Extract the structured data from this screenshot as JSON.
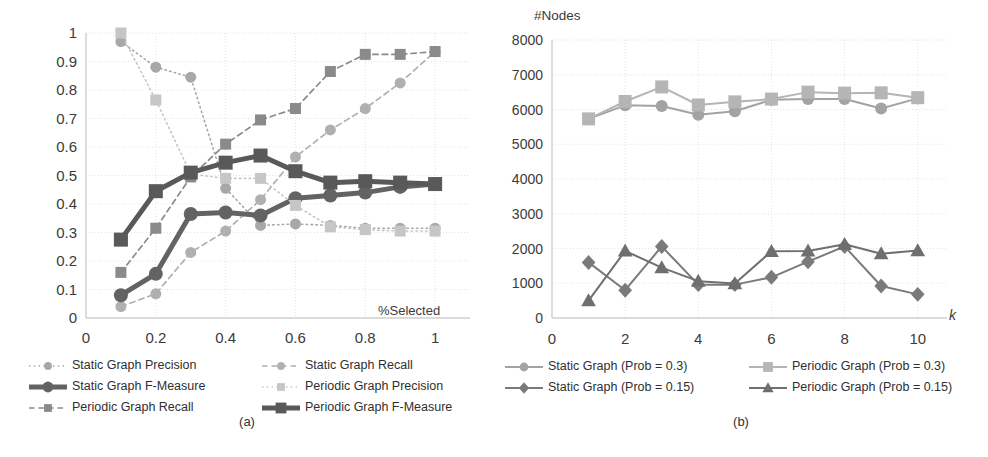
{
  "figure": {
    "panels": [
      {
        "id": "a",
        "caption": "(a)",
        "chart_data": {
          "type": "line",
          "title": "",
          "xlabel": "%Selected",
          "ylabel": "",
          "xlim": [
            0,
            1.1
          ],
          "ylim": [
            0,
            1
          ],
          "xticks": [
            "0",
            "0.2",
            "0.4",
            "0.6",
            "0.8",
            "1"
          ],
          "xtick_values": [
            0,
            0.2,
            0.4,
            0.6,
            0.8,
            1.0
          ],
          "yticks": [
            "0",
            "0.1",
            "0.2",
            "0.3",
            "0.4",
            "0.5",
            "0.6",
            "0.7",
            "0.8",
            "0.9",
            "1"
          ],
          "ytick_values": [
            0,
            0.1,
            0.2,
            0.3,
            0.4,
            0.5,
            0.6,
            0.7,
            0.8,
            0.9,
            1.0
          ],
          "grid": true,
          "legend_position": "below",
          "x": [
            0.1,
            0.2,
            0.3,
            0.4,
            0.5,
            0.6,
            0.7,
            0.8,
            0.9,
            1.0
          ],
          "series": [
            {
              "name": "Static Graph Precision",
              "key": "static-precision",
              "values": [
                0.97,
                0.88,
                0.845,
                0.455,
                0.325,
                0.33,
                0.325,
                0.315,
                0.315,
                0.315
              ],
              "color": "#a8a8a8",
              "style": "dotted",
              "marker": "circle",
              "width": 1.6,
              "marker_size": 5.5
            },
            {
              "name": "Static Graph Recall",
              "key": "static-recall",
              "values": [
                0.04,
                0.085,
                0.23,
                0.305,
                0.415,
                0.565,
                0.66,
                0.735,
                0.825,
                0.935
              ],
              "color": "#b0b0b0",
              "style": "dashed",
              "marker": "circle",
              "width": 1.7,
              "marker_size": 5.5
            },
            {
              "name": "Static Graph F-Measure",
              "key": "static-fmeasure",
              "values": [
                0.08,
                0.155,
                0.365,
                0.37,
                0.36,
                0.42,
                0.43,
                0.44,
                0.46,
                0.47
              ],
              "color": "#636363",
              "style": "solid",
              "marker": "circle",
              "width": 5,
              "marker_size": 7
            },
            {
              "name": "Periodic Graph Precision",
              "key": "periodic-precision",
              "values": [
                1.0,
                0.765,
                0.505,
                0.49,
                0.49,
                0.395,
                0.32,
                0.31,
                0.305,
                0.305
              ],
              "color": "#c6c6c6",
              "style": "dotted",
              "marker": "square",
              "width": 1.6,
              "marker_size": 5.5
            },
            {
              "name": "Periodic Graph Recall",
              "key": "periodic-recall",
              "values": [
                0.16,
                0.315,
                0.495,
                0.61,
                0.695,
                0.735,
                0.865,
                0.925,
                0.925,
                0.935
              ],
              "color": "#8a8a8a",
              "style": "dashed",
              "marker": "square",
              "width": 1.7,
              "marker_size": 5.5
            },
            {
              "name": "Periodic Graph F-Measure",
              "key": "periodic-fmeasure",
              "values": [
                0.275,
                0.445,
                0.51,
                0.545,
                0.57,
                0.515,
                0.475,
                0.48,
                0.475,
                0.47
              ],
              "color": "#595959",
              "style": "solid",
              "marker": "square",
              "width": 5,
              "marker_size": 7
            }
          ]
        }
      },
      {
        "id": "b",
        "caption": "(b)",
        "chart_data": {
          "type": "line",
          "title": "",
          "xlabel": "k",
          "ylabel": "#Nodes",
          "xlim": [
            0,
            10.8
          ],
          "ylim": [
            0,
            8000
          ],
          "xticks": [
            "0",
            "2",
            "4",
            "6",
            "8",
            "10"
          ],
          "xtick_values": [
            0,
            2,
            4,
            6,
            8,
            10
          ],
          "yticks": [
            "0",
            "1000",
            "2000",
            "3000",
            "4000",
            "5000",
            "6000",
            "7000",
            "8000"
          ],
          "ytick_values": [
            0,
            1000,
            2000,
            3000,
            4000,
            5000,
            6000,
            7000,
            8000
          ],
          "grid": true,
          "legend_position": "below",
          "x": [
            1,
            2,
            3,
            4,
            5,
            6,
            7,
            8,
            9,
            10
          ],
          "series": [
            {
              "name": "Static Graph (Prob = 0.3)",
              "key": "static-prob-03",
              "values": [
                5730,
                6120,
                6100,
                5850,
                5950,
                6280,
                6300,
                6300,
                6030,
                6320
              ],
              "color": "#a3a3a3",
              "style": "solid",
              "marker": "circle",
              "width": 2,
              "marker_size": 6
            },
            {
              "name": "Periodic Graph (Prob = 0.3)",
              "key": "periodic-prob-03",
              "values": [
                5730,
                6230,
                6650,
                6130,
                6220,
                6300,
                6500,
                6470,
                6480,
                6340
              ],
              "color": "#b5b5b5",
              "style": "solid",
              "marker": "square",
              "width": 2,
              "marker_size": 6.5
            },
            {
              "name": "Static Graph (Prob = 0.15)",
              "key": "static-prob-015",
              "values": [
                1600,
                800,
                2060,
                960,
                960,
                1170,
                1620,
                2060,
                920,
                680
              ],
              "color": "#7a7a7a",
              "style": "solid",
              "marker": "diamond",
              "width": 2,
              "marker_size": 6.5
            },
            {
              "name": "Periodic Graph (Prob = 0.15)",
              "key": "periodic-prob-015",
              "values": [
                500,
                1930,
                1450,
                1060,
                990,
                1920,
                1930,
                2120,
                1850,
                1940
              ],
              "color": "#6f6f6f",
              "style": "solid",
              "marker": "triangle",
              "width": 2,
              "marker_size": 7
            }
          ]
        }
      }
    ]
  }
}
